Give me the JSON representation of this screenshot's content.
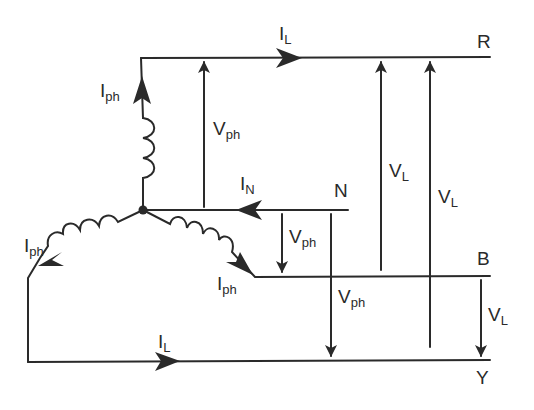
{
  "diagram": {
    "colors": {
      "line": "#2a2a2a",
      "background": "#ffffff"
    },
    "terminals": {
      "r": "R",
      "b": "B",
      "y": "Y",
      "n": "N"
    },
    "currents": {
      "line_top": {
        "main": "I",
        "sub": "L"
      },
      "line_bottom": {
        "main": "I",
        "sub": "L"
      },
      "neutral": {
        "main": "I",
        "sub": "N"
      },
      "phase_top": {
        "main": "I",
        "sub": "ph"
      },
      "phase_left": {
        "main": "I",
        "sub": "ph"
      },
      "phase_right": {
        "main": "I",
        "sub": "ph"
      }
    },
    "voltages": {
      "phase_rn": {
        "main": "V",
        "sub": "ph"
      },
      "phase_nb": {
        "main": "V",
        "sub": "ph"
      },
      "phase_ny": {
        "main": "V",
        "sub": "ph"
      },
      "line_rb": {
        "main": "V",
        "sub": "L"
      },
      "line_ry": {
        "main": "V",
        "sub": "L"
      },
      "line_by": {
        "main": "V",
        "sub": "L"
      }
    }
  }
}
